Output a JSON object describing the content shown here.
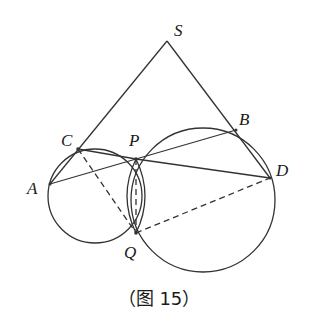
{
  "figure": {
    "caption": "（图 15）",
    "points": {
      "S": {
        "label": "S",
        "x": 167,
        "y": 41
      },
      "A": {
        "label": "A",
        "x": 50,
        "y": 184
      },
      "C": {
        "label": "C",
        "x": 78,
        "y": 149
      },
      "P": {
        "label": "P",
        "x": 136,
        "y": 159
      },
      "B": {
        "label": "B",
        "x": 236,
        "y": 130
      },
      "D": {
        "label": "D",
        "x": 270,
        "y": 178
      },
      "Q": {
        "label": "Q",
        "x": 136,
        "y": 233
      }
    },
    "circles": [
      {
        "name": "left-circle",
        "through": [
          "A",
          "C",
          "P",
          "Q"
        ]
      },
      {
        "name": "right-circle",
        "through": [
          "P",
          "B",
          "D",
          "Q"
        ]
      }
    ],
    "solid_segments": [
      "S-A",
      "S-D",
      "A-P",
      "P-B",
      "C-P",
      "P-D"
    ],
    "dashed_segments": [
      "C-Q",
      "P-Q",
      "Q-D"
    ],
    "stroke_color": "#333333"
  }
}
